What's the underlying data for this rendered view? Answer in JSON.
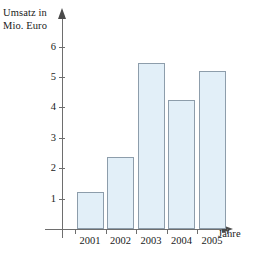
{
  "chart_data": {
    "type": "bar",
    "title": "",
    "subtitle": "",
    "xlabel": "Jahre",
    "ylabel": "Umsatz in\nMio. Euro",
    "categories": [
      "2001",
      "2002",
      "2003",
      "2004",
      "2005"
    ],
    "values": [
      1.22,
      2.37,
      5.45,
      4.25,
      5.2
    ],
    "ytick_labels": [
      "1",
      "2",
      "3",
      "4",
      "5",
      "6"
    ],
    "ytick_values": [
      1,
      2,
      3,
      4,
      5,
      6
    ],
    "ylim": [
      0,
      6.6
    ],
    "grid": false,
    "legend": null,
    "bar_fill_color": "#e2eff8",
    "bar_border_color": "#8d9dab",
    "axis_color": "#6e6e6e",
    "text_color": "#1a1a1a"
  }
}
